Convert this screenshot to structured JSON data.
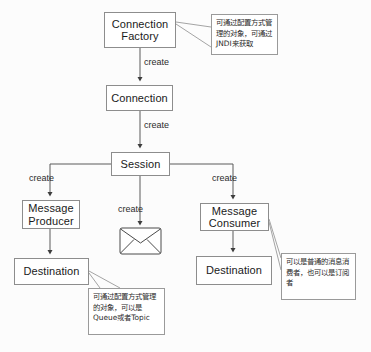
{
  "diagram": {
    "nodes": [
      {
        "id": "connection-factory",
        "label": "Connection\nFactory"
      },
      {
        "id": "connection",
        "label": "Connection"
      },
      {
        "id": "session",
        "label": "Session"
      },
      {
        "id": "message-producer",
        "label": "Message\nProducer"
      },
      {
        "id": "message-consumer",
        "label": "Message\nConsumer"
      },
      {
        "id": "destination-left",
        "label": "Destination"
      },
      {
        "id": "destination-right",
        "label": "Destination"
      }
    ],
    "edge_labels": {
      "factory_to_connection": "create",
      "connection_to_session": "create",
      "session_to_producer": "create",
      "session_to_message": "create",
      "session_to_consumer": "create"
    },
    "message_icon": "envelope-icon",
    "notes": [
      {
        "id": "note-connection-factory",
        "text": "可通过配置方式管理的对象，可通过JNDI来获取"
      },
      {
        "id": "note-message-consumer",
        "text": "可以是普通的消息消费者，也可以是订阅者"
      },
      {
        "id": "note-destination",
        "text": "可通过配置方式管理的对象，可以是Queue或者Topic"
      }
    ],
    "colors": {
      "background": "#fcfcfc",
      "node_border": "#8d8d8d",
      "node_fill": "#ffffff",
      "line": "#5a5a5a",
      "note_border": "#9a9a9a",
      "text": "#1a1a1a"
    }
  }
}
